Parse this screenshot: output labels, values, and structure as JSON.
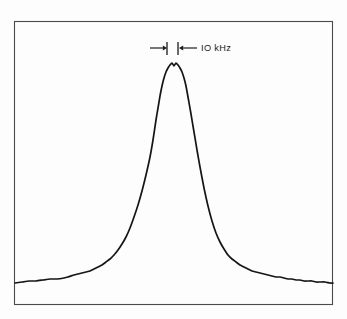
{
  "figure": {
    "background_color": "#fdfdfd",
    "frame": {
      "name": "plot-frame",
      "x": 14,
      "y": 21,
      "width": 319,
      "height": 284,
      "stroke_color": "#4a4a4a",
      "stroke_width": 1.1
    },
    "trace": {
      "name": "spectral-lineshape-trace",
      "stroke_color": "#151515",
      "stroke_width": 1.7,
      "description": "Narrow spectral line with flat double-peaked top and broad Lorentzian wings"
    },
    "annotation": {
      "label": "IO kHz",
      "label_x": 201,
      "label_y": 51,
      "left_arrow": {
        "x1": 150,
        "x2": 167,
        "y": 48
      },
      "right_arrow": {
        "x1": 197,
        "x2": 179,
        "y": 48
      },
      "left_tick": {
        "x": 167,
        "y1": 42,
        "y2": 55
      },
      "right_tick": {
        "x": 178,
        "y1": 42,
        "y2": 55
      },
      "color": "#1b1b1b"
    }
  },
  "chart_data": {
    "type": "line",
    "title": "",
    "subtitle": "",
    "xlabel": "",
    "ylabel": "",
    "xlim": [
      14,
      333
    ],
    "ylim": [
      21,
      305
    ],
    "grid": false,
    "legend": null,
    "axis_ticks": {
      "x": [],
      "y": []
    },
    "annotations": [
      {
        "text": "IO kHz",
        "kind": "double-headed-width-marker",
        "meaning": "linewidth marker spanning the central dip of the peak",
        "x_from": 167,
        "x_to": 178,
        "y": 48
      }
    ],
    "series": [
      {
        "name": "spectral line",
        "color": "#151515",
        "note": "pixel coordinates; y increases downward, baseline at y=282, peak top at y=63",
        "x": [
          15,
          22,
          29,
          36,
          43,
          50,
          57,
          64,
          68,
          71,
          74,
          78,
          82,
          86,
          90,
          94,
          98,
          102,
          106,
          110,
          114,
          118,
          122,
          126,
          130,
          134,
          138,
          142,
          146,
          150,
          153,
          156,
          158,
          160,
          162,
          164,
          166,
          168,
          170,
          172,
          174,
          176,
          178,
          180,
          182,
          184,
          186,
          188,
          191,
          194,
          197,
          200,
          204,
          208,
          212,
          216,
          220,
          224,
          228,
          232,
          236,
          240,
          244,
          248,
          252,
          256,
          260,
          264,
          268,
          272,
          276,
          280,
          284,
          288,
          292,
          296,
          300,
          304,
          308,
          312,
          316,
          320,
          325,
          330,
          333
        ],
        "y": [
          283,
          282,
          281,
          281,
          280,
          279,
          279,
          278,
          277,
          276,
          275,
          274,
          273,
          272,
          271,
          269,
          267,
          265,
          262,
          259,
          255,
          250,
          244,
          237,
          228,
          217,
          205,
          191,
          175,
          157,
          140,
          120,
          108,
          96,
          86,
          78,
          72,
          68,
          65,
          63,
          66,
          63,
          65,
          68,
          72,
          78,
          86,
          97,
          114,
          132,
          150,
          167,
          188,
          206,
          221,
          233,
          242,
          249,
          255,
          259,
          262,
          265,
          267,
          269,
          271,
          272,
          273,
          274,
          275,
          276,
          277,
          277,
          278,
          279,
          279,
          280,
          280,
          281,
          281,
          281,
          282,
          282,
          282,
          283,
          283
        ]
      }
    ]
  }
}
